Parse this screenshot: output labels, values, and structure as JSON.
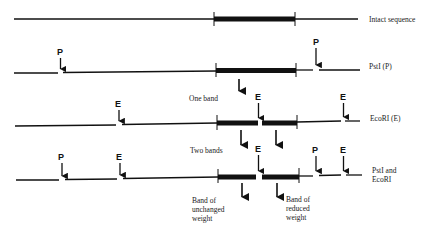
{
  "diagram": {
    "rows": [
      {
        "label": "Intact sequence",
        "sites": []
      },
      {
        "label": "PstI (P)",
        "sites": [
          "P",
          "P"
        ]
      },
      {
        "label": "EcoRI (E)",
        "sites": [
          "E",
          "E",
          "E"
        ]
      },
      {
        "label_line1": "PstI and",
        "label_line2": "EcoRI",
        "sites": [
          "P",
          "E",
          "E",
          "P",
          "E"
        ]
      }
    ],
    "site_letters": {
      "pstI": "P",
      "ecoRI": "E"
    },
    "annotations": {
      "one_band": "One band",
      "two_bands": "Two bands",
      "band_unchanged": {
        "line1": "Band of",
        "line2": "unchanged",
        "line3": "weight"
      },
      "band_reduced": {
        "line1": "Band of",
        "line2": "reduced",
        "line3": "weight"
      }
    },
    "colors": {
      "ink": "#111111",
      "background": "#ffffff"
    }
  }
}
